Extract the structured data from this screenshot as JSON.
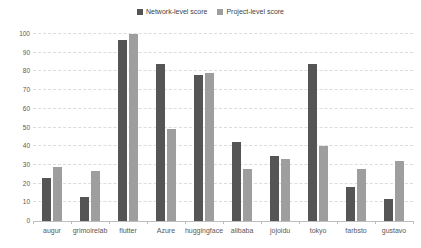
{
  "chart_data": {
    "type": "bar",
    "title": "",
    "categories": [
      "augur",
      "grimoirelab",
      "flutter",
      "Azure",
      "huggingface",
      "alibaba",
      "jojoidu",
      "tokyo",
      "farbsto",
      "gustavo"
    ],
    "series": [
      {
        "name": "Network-level score",
        "color": "#555555",
        "values": [
          23,
          13,
          97,
          84,
          78,
          42,
          35,
          84,
          18,
          12
        ]
      },
      {
        "name": "Project-level score",
        "color": "#9e9e9e",
        "values": [
          29,
          27,
          100,
          49,
          79,
          28,
          33,
          40,
          28,
          32
        ]
      }
    ],
    "xlabel": "",
    "ylabel": "",
    "ylim": [
      0,
      100
    ],
    "yticks": [
      0,
      10,
      20,
      30,
      40,
      50,
      60,
      70,
      80,
      90,
      100
    ],
    "grid": "horizontal-dashed",
    "legend_position": "top-center"
  },
  "colors": {
    "background": "#ffffff",
    "gridline": "#dcdcdc",
    "axis_line": "#bdbdbd",
    "tick_text": "#595959",
    "legend_text": "#3f3f3f"
  }
}
